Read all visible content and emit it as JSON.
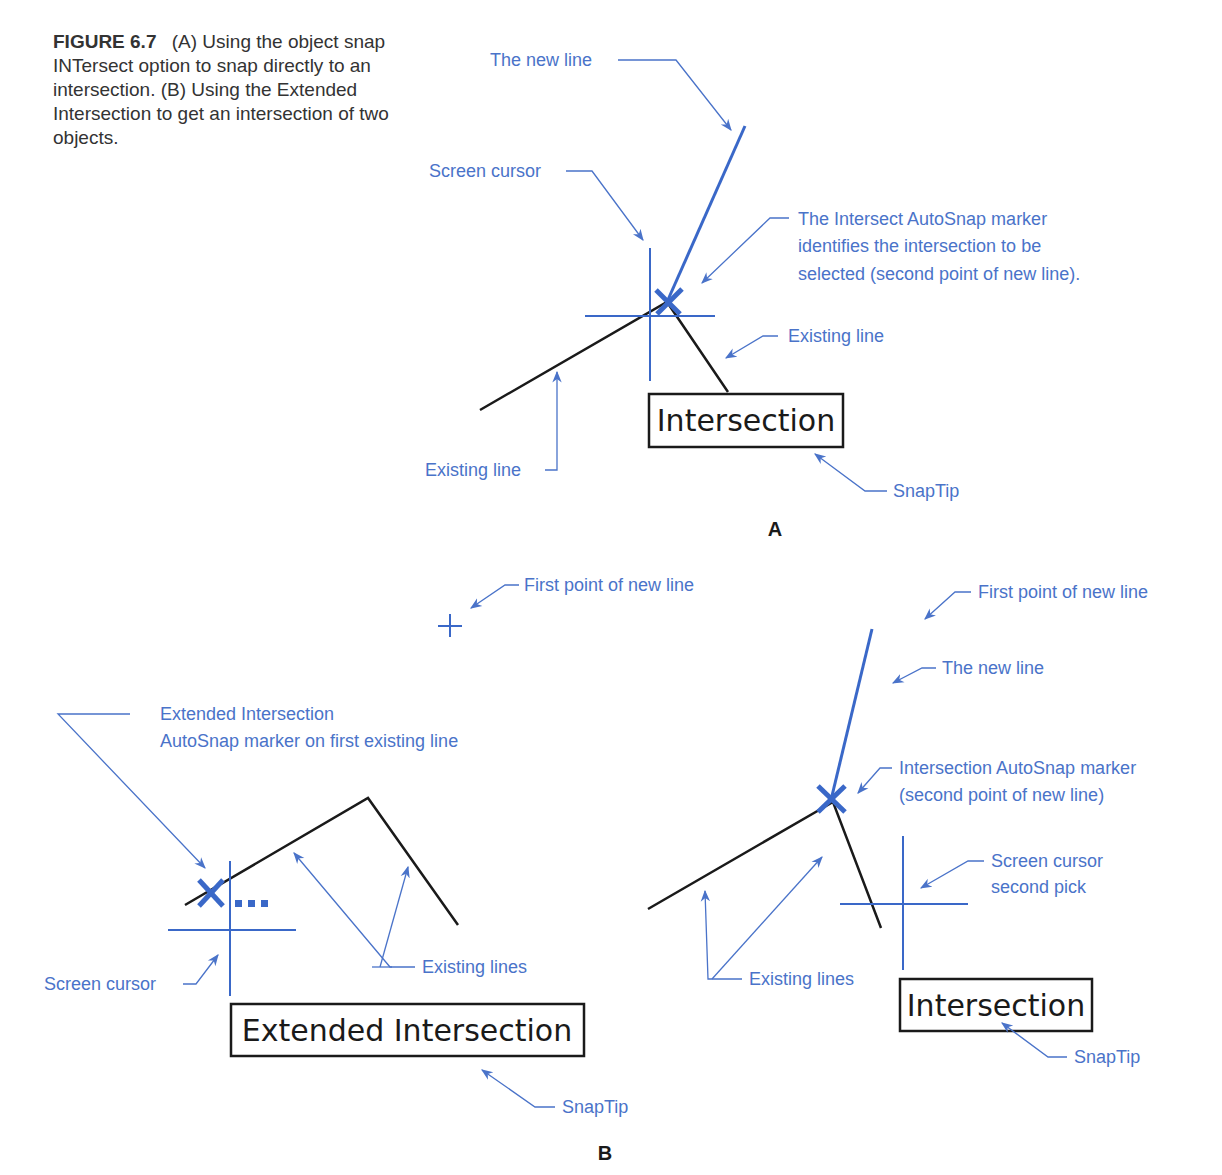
{
  "caption": {
    "figure_number": "FIGURE 6.7",
    "text": "(A) Using the object snap INTersect option to snap directly to an intersection. (B) Using the Extended Intersection to get an intersection of two objects."
  },
  "colors": {
    "annotation_blue": "#4a73c9",
    "line_blue": "#3a68c8",
    "existing_line_black": "#1a1a1a"
  },
  "panel_a": {
    "label": "A",
    "annotations": {
      "new_line": "The new line",
      "screen_cursor": "Screen cursor",
      "marker_line1": "The Intersect AutoSnap marker",
      "marker_line2": "identifies the intersection to be",
      "marker_line3": "selected (second point of new line).",
      "existing_line_right": "Existing line",
      "existing_line_left": "Existing line",
      "snaptip": "SnapTip"
    },
    "snaptip_box": "Intersection"
  },
  "panel_b": {
    "label": "B",
    "left": {
      "first_point": "First point of new line",
      "ext_marker_line1": "Extended Intersection",
      "ext_marker_line2": "AutoSnap marker on first existing line",
      "existing_lines": "Existing lines",
      "screen_cursor": "Screen cursor",
      "snaptip_box": "Extended Intersection",
      "snaptip": "SnapTip"
    },
    "right": {
      "first_point": "First point of new line",
      "new_line": "The new line",
      "marker_line1": "Intersection AutoSnap marker",
      "marker_line2": "(second point of new line)",
      "cursor_line1": "Screen cursor",
      "cursor_line2": "second pick",
      "existing_lines": "Existing lines",
      "snaptip_box": "Intersection",
      "snaptip": "SnapTip"
    }
  }
}
